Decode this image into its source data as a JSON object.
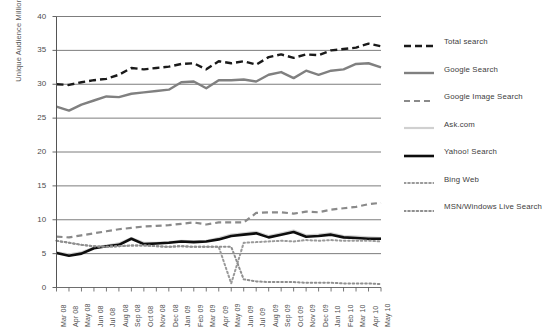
{
  "chart_data": {
    "type": "line",
    "title": "",
    "xlabel": "",
    "ylabel": "Unique Audience Millions",
    "ylim": [
      0,
      40
    ],
    "ytick_labels": [
      "40",
      "35",
      "30",
      "25",
      "20",
      "15",
      "10",
      "5",
      "0"
    ],
    "ytick_values": [
      40,
      35,
      30,
      25,
      20,
      15,
      10,
      5,
      0
    ],
    "grid": true,
    "legend_position": "right",
    "categories": [
      "Mar 08",
      "Apr 08",
      "May 08",
      "Jun 08",
      "Jul 08",
      "Aug 08",
      "Sep 08",
      "Oct 08",
      "Nov 08",
      "Dec 08",
      "Jan 09",
      "Feb 09",
      "Mar 09",
      "Apr 09",
      "May 09",
      "Jun 09",
      "Jul 09",
      "Aug 09",
      "Sep 09",
      "Oct 09",
      "Nov 09",
      "Dec 09",
      "Jan 10",
      "Feb 10",
      "Mar 10",
      "Apr 10",
      "May 10"
    ],
    "series": [
      {
        "name": "Total search",
        "color": "#1a1a1a",
        "style": "dashed",
        "width": 2.4,
        "dash": "7,4",
        "values": [
          30.0,
          29.9,
          30.3,
          30.6,
          30.8,
          31.4,
          32.4,
          32.2,
          32.4,
          32.6,
          33.0,
          33.1,
          32.2,
          33.4,
          33.1,
          33.4,
          32.9,
          34.0,
          34.4,
          33.9,
          34.4,
          34.3,
          35.0,
          35.2,
          35.4,
          36.0,
          35.6
        ]
      },
      {
        "name": "Google Search",
        "color": "#808080",
        "style": "solid",
        "width": 2.4,
        "dash": "",
        "values": [
          26.7,
          26.1,
          27.0,
          27.6,
          28.2,
          28.1,
          28.6,
          28.8,
          29.0,
          29.2,
          30.3,
          30.4,
          29.4,
          30.6,
          30.6,
          30.7,
          30.4,
          31.4,
          31.8,
          30.9,
          32.0,
          31.4,
          32.0,
          32.2,
          33.0,
          33.1,
          32.5
        ]
      },
      {
        "name": "Google Image Search",
        "color": "#8a8a8a",
        "style": "dashed",
        "width": 2.2,
        "dash": "6,4",
        "values": [
          7.5,
          7.4,
          7.7,
          8.0,
          8.3,
          8.6,
          8.8,
          9.0,
          9.1,
          9.2,
          9.4,
          9.6,
          9.3,
          9.6,
          9.6,
          9.6,
          11.0,
          11.1,
          11.1,
          10.9,
          11.2,
          11.1,
          11.5,
          11.7,
          11.9,
          12.3,
          12.5
        ]
      },
      {
        "name": "Ask.com",
        "color": "#d0d0d0",
        "style": "solid",
        "width": 2.2,
        "dash": "",
        "values": [
          5.2,
          4.9,
          5.2,
          5.9,
          6.2,
          6.5,
          7.3,
          6.6,
          6.6,
          6.7,
          6.9,
          6.8,
          6.9,
          7.3,
          7.8,
          8.0,
          8.2,
          7.6,
          8.0,
          8.4,
          7.7,
          7.8,
          8.0,
          7.6,
          7.5,
          7.4,
          7.3
        ]
      },
      {
        "name": "Yahoo! Search",
        "color": "#0d0d0d",
        "style": "solid",
        "width": 2.6,
        "dash": "",
        "values": [
          5.1,
          4.7,
          5.0,
          5.8,
          6.1,
          6.3,
          7.2,
          6.4,
          6.5,
          6.6,
          6.8,
          6.7,
          6.8,
          7.1,
          7.6,
          7.8,
          8.0,
          7.4,
          7.8,
          8.2,
          7.5,
          7.6,
          7.8,
          7.4,
          7.3,
          7.2,
          7.2
        ]
      },
      {
        "name": "Bing Web",
        "color": "#9a9a9a",
        "style": "dotted",
        "width": 2.0,
        "dash": "1.6,2.6",
        "values": [
          6.9,
          6.6,
          6.3,
          6.1,
          6.0,
          6.1,
          6.2,
          6.2,
          6.1,
          6.0,
          6.1,
          6.0,
          6.0,
          6.0,
          0.6,
          6.6,
          6.7,
          6.8,
          6.9,
          6.8,
          7.0,
          6.9,
          7.0,
          6.9,
          6.9,
          6.9,
          6.8
        ]
      },
      {
        "name": "MSN/Windows Live Search",
        "color": "#8f8f8f",
        "style": "dotted",
        "width": 2.0,
        "dash": "1.6,2.6",
        "values": [
          6.9,
          6.6,
          6.3,
          6.1,
          6.0,
          6.1,
          6.2,
          6.2,
          6.1,
          6.0,
          6.1,
          6.0,
          6.0,
          6.0,
          6.0,
          1.2,
          0.9,
          0.8,
          0.8,
          0.8,
          0.7,
          0.7,
          0.7,
          0.6,
          0.6,
          0.6,
          0.5
        ]
      }
    ]
  }
}
